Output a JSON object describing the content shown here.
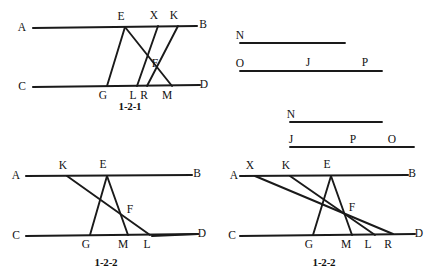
{
  "sheet": {
    "width": 445,
    "height": 277,
    "background": "#ffffff",
    "ink": "#1a1a1a"
  },
  "panels": [
    {
      "id": "panel-1-2-1",
      "name": "figure-1-2-1",
      "caption": "1-2-1",
      "caption_pos": {
        "x": 130,
        "y": 110
      },
      "baselines": [
        {
          "name": "line-AB",
          "x1": 33,
          "y1": 28,
          "x2": 197,
          "y2": 26
        },
        {
          "name": "line-CD",
          "x1": 33,
          "y1": 87,
          "x2": 200,
          "y2": 85
        }
      ],
      "segments": [
        {
          "name": "segment-EG",
          "x1": 125,
          "y1": 27,
          "x2": 107,
          "y2": 86
        },
        {
          "name": "segment-EM",
          "x1": 125,
          "y1": 27,
          "x2": 172,
          "y2": 86
        },
        {
          "name": "segment-XL",
          "x1": 158,
          "y1": 26,
          "x2": 137,
          "y2": 86
        },
        {
          "name": "segment-KR",
          "x1": 178,
          "y1": 26,
          "x2": 147,
          "y2": 86
        }
      ],
      "labels": [
        {
          "name": "label-A",
          "text": "A",
          "x": 22,
          "y": 31
        },
        {
          "name": "label-B",
          "text": "B",
          "x": 203,
          "y": 28
        },
        {
          "name": "label-C",
          "text": "C",
          "x": 22,
          "y": 90
        },
        {
          "name": "label-D",
          "text": "D",
          "x": 204,
          "y": 88
        },
        {
          "name": "label-E",
          "text": "E",
          "x": 121,
          "y": 20
        },
        {
          "name": "label-X",
          "text": "X",
          "x": 154,
          "y": 19
        },
        {
          "name": "label-K",
          "text": "K",
          "x": 174,
          "y": 19
        },
        {
          "name": "label-F",
          "text": "F",
          "x": 155,
          "y": 67
        },
        {
          "name": "label-G",
          "text": "G",
          "x": 103,
          "y": 99
        },
        {
          "name": "label-L",
          "text": "L",
          "x": 133,
          "y": 99
        },
        {
          "name": "label-R",
          "text": "R",
          "x": 144,
          "y": 99
        },
        {
          "name": "label-M",
          "text": "M",
          "x": 167,
          "y": 99
        }
      ]
    },
    {
      "id": "panel-1-2-2-left",
      "name": "figure-1-2-2-left",
      "caption": "1-2-2",
      "caption_pos": {
        "x": 106,
        "y": 266
      },
      "baselines": [
        {
          "name": "line-AB",
          "x1": 26,
          "y1": 176,
          "x2": 192,
          "y2": 175
        },
        {
          "name": "line-CD",
          "x1": 26,
          "y1": 236,
          "x2": 198,
          "y2": 234
        },
        {
          "name": "line-CD-right",
          "x1": 152,
          "y1": 236,
          "x2": 198,
          "y2": 234
        }
      ],
      "segments": [
        {
          "name": "segment-EG",
          "x1": 107,
          "y1": 176,
          "x2": 90,
          "y2": 235
        },
        {
          "name": "segment-EM",
          "x1": 107,
          "y1": 176,
          "x2": 128,
          "y2": 235
        },
        {
          "name": "segment-KL",
          "x1": 67,
          "y1": 176,
          "x2": 150,
          "y2": 235
        }
      ],
      "labels": [
        {
          "name": "label-A",
          "text": "A",
          "x": 16,
          "y": 179
        },
        {
          "name": "label-B",
          "text": "B",
          "x": 197,
          "y": 177
        },
        {
          "name": "label-C",
          "text": "C",
          "x": 16,
          "y": 239
        },
        {
          "name": "label-D",
          "text": "D",
          "x": 202,
          "y": 237
        },
        {
          "name": "label-K",
          "text": "K",
          "x": 63,
          "y": 169
        },
        {
          "name": "label-E",
          "text": "E",
          "x": 103,
          "y": 168
        },
        {
          "name": "label-F",
          "text": "F",
          "x": 130,
          "y": 213
        },
        {
          "name": "label-G",
          "text": "G",
          "x": 86,
          "y": 248
        },
        {
          "name": "label-M",
          "text": "M",
          "x": 123,
          "y": 248
        },
        {
          "name": "label-L",
          "text": "L",
          "x": 147,
          "y": 248
        }
      ]
    },
    {
      "id": "panel-1-2-2-right",
      "name": "figure-1-2-2-right",
      "caption": "1-2-2",
      "caption_pos": {
        "x": 324,
        "y": 266
      },
      "baselines": [
        {
          "name": "line-AB",
          "x1": 240,
          "y1": 176,
          "x2": 408,
          "y2": 175
        },
        {
          "name": "line-CD",
          "x1": 240,
          "y1": 236,
          "x2": 415,
          "y2": 234
        }
      ],
      "segments": [
        {
          "name": "segment-EG",
          "x1": 331,
          "y1": 176,
          "x2": 313,
          "y2": 235
        },
        {
          "name": "segment-EM",
          "x1": 331,
          "y1": 176,
          "x2": 352,
          "y2": 235
        },
        {
          "name": "segment-KL",
          "x1": 290,
          "y1": 176,
          "x2": 375,
          "y2": 235
        },
        {
          "name": "segment-XR",
          "x1": 255,
          "y1": 176,
          "x2": 393,
          "y2": 234
        }
      ],
      "labels": [
        {
          "name": "label-A",
          "text": "A",
          "x": 234,
          "y": 179
        },
        {
          "name": "label-B",
          "text": "B",
          "x": 412,
          "y": 177
        },
        {
          "name": "label-C",
          "text": "C",
          "x": 232,
          "y": 239
        },
        {
          "name": "label-D",
          "text": "D",
          "x": 419,
          "y": 237
        },
        {
          "name": "label-X",
          "text": "X",
          "x": 250,
          "y": 169
        },
        {
          "name": "label-K",
          "text": "K",
          "x": 286,
          "y": 169
        },
        {
          "name": "label-E",
          "text": "E",
          "x": 327,
          "y": 168
        },
        {
          "name": "label-F",
          "text": "F",
          "x": 352,
          "y": 211
        },
        {
          "name": "label-G",
          "text": "G",
          "x": 309,
          "y": 248
        },
        {
          "name": "label-M",
          "text": "M",
          "x": 346,
          "y": 248
        },
        {
          "name": "label-L",
          "text": "L",
          "x": 368,
          "y": 248
        },
        {
          "name": "label-R",
          "text": "R",
          "x": 388,
          "y": 248
        }
      ]
    },
    {
      "id": "panel-ruler-top",
      "name": "figure-ruler-top",
      "caption": "",
      "caption_pos": {
        "x": 0,
        "y": 0
      },
      "baselines": [],
      "segments": [
        {
          "name": "ruler-N",
          "x1": 240,
          "y1": 43,
          "x2": 345,
          "y2": 43
        },
        {
          "name": "ruler-O",
          "x1": 240,
          "y1": 71,
          "x2": 382,
          "y2": 71
        }
      ],
      "labels": [
        {
          "name": "label-N",
          "text": "N",
          "x": 240,
          "y": 39
        },
        {
          "name": "label-O",
          "text": "O",
          "x": 240,
          "y": 67
        },
        {
          "name": "label-J",
          "text": "J",
          "x": 308,
          "y": 66
        },
        {
          "name": "label-P",
          "text": "P",
          "x": 365,
          "y": 66
        }
      ]
    },
    {
      "id": "panel-ruler-bottom",
      "name": "figure-ruler-bottom",
      "caption": "",
      "caption_pos": {
        "x": 0,
        "y": 0
      },
      "baselines": [],
      "segments": [
        {
          "name": "ruler-N",
          "x1": 290,
          "y1": 122,
          "x2": 382,
          "y2": 122
        },
        {
          "name": "ruler-J",
          "x1": 290,
          "y1": 147,
          "x2": 414,
          "y2": 147
        }
      ],
      "labels": [
        {
          "name": "label-N",
          "text": "N",
          "x": 291,
          "y": 118
        },
        {
          "name": "label-J",
          "text": "J",
          "x": 291,
          "y": 143
        },
        {
          "name": "label-P",
          "text": "P",
          "x": 353,
          "y": 143
        },
        {
          "name": "label-O",
          "text": "O",
          "x": 392,
          "y": 143
        }
      ]
    }
  ]
}
